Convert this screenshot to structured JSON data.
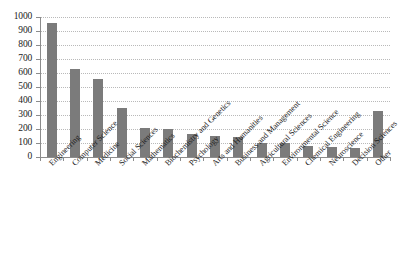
{
  "chart_data": {
    "type": "bar",
    "title": "",
    "subtitle": "",
    "xlabel": "",
    "ylabel": "",
    "ylim": [
      0,
      1000
    ],
    "ytick_step": 100,
    "grid": true,
    "legend": false,
    "legend_position": "none",
    "bar_color": "#7b7b7b",
    "categories": [
      "Engineering",
      "Computer Science",
      "Medicine",
      "Social Sciences",
      "Mathematics",
      "Biochemistry and Genetics",
      "Psychology",
      "Arts and Humanities",
      "Business and Management",
      "Agricultural Sciences",
      "Environmental Science",
      "Chemical Engineering",
      "Neuroscience",
      "Decision Sciences",
      "Other"
    ],
    "values": [
      960,
      630,
      555,
      350,
      210,
      200,
      165,
      150,
      140,
      100,
      100,
      80,
      75,
      65,
      330
    ],
    "ytick_labels": [
      "0",
      "100",
      "200",
      "300",
      "400",
      "500",
      "600",
      "700",
      "800",
      "900",
      "1000"
    ],
    "ytick_values": [
      0,
      100,
      200,
      300,
      400,
      500,
      600,
      700,
      800,
      900,
      1000
    ]
  }
}
